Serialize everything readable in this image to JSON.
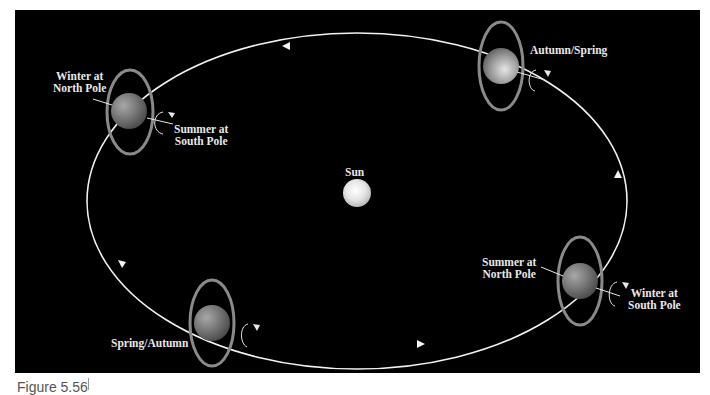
{
  "diagram": {
    "colors": {
      "background": "#000000",
      "orbit": "#f2f2f2",
      "ring": "#8a8a8a",
      "sun": "#f0f0f0",
      "label": "#e8e8e8"
    },
    "sun": {
      "label": "Sun"
    },
    "positions": [
      {
        "id": "top-left",
        "label_tilt": "Winter at\nNorth Pole",
        "label_tilt_line1": "Winter at",
        "label_tilt_line2": "North Pole",
        "label_opposite_line1": "Summer at",
        "label_opposite_line2": "South Pole"
      },
      {
        "id": "top-right",
        "label": "Autumn/Spring"
      },
      {
        "id": "bottom-right",
        "label_tilt_line1": "Summer at",
        "label_tilt_line2": "North Pole",
        "label_opposite_line1": "Winter at",
        "label_opposite_line2": "South Pole"
      },
      {
        "id": "bottom-left",
        "label": "Spring/Autumn"
      }
    ]
  },
  "caption": {
    "text": "Figure 5.56"
  }
}
